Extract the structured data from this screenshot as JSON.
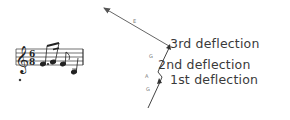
{
  "diagram": {
    "labels": {
      "third": "3rd deflection",
      "second": "2nd deflection",
      "first": "1st deflection"
    },
    "path_notes": [
      "G",
      "A",
      "G",
      "E"
    ],
    "music_notation": {
      "clef": "treble",
      "time_signature": "6/8"
    }
  }
}
